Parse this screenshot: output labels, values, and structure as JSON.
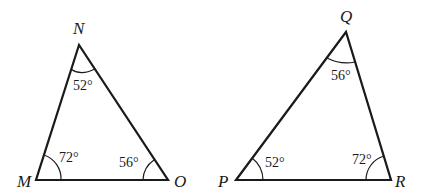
{
  "figure": {
    "triangles": [
      {
        "name": "MNO",
        "vertices": {
          "top": {
            "label": "N",
            "angle": "52°"
          },
          "bottom_left": {
            "label": "M",
            "angle": "72°"
          },
          "bottom_right": {
            "label": "O",
            "angle": "56°"
          }
        }
      },
      {
        "name": "PQR",
        "vertices": {
          "top": {
            "label": "Q",
            "angle": "56°"
          },
          "bottom_left": {
            "label": "P",
            "angle": "52°"
          },
          "bottom_right": {
            "label": "R",
            "angle": "72°"
          }
        }
      }
    ]
  }
}
